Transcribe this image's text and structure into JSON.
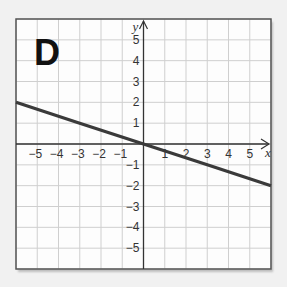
{
  "panel": {
    "label": "D"
  },
  "chart_data": {
    "type": "line",
    "title": "D",
    "xlabel": "x",
    "ylabel": "y",
    "xlim": [
      -6,
      6
    ],
    "ylim": [
      -6,
      6
    ],
    "grid": true,
    "x_ticks": [
      -5,
      -4,
      -3,
      -2,
      -1,
      1,
      2,
      3,
      4,
      5
    ],
    "y_ticks": [
      5,
      4,
      3,
      2,
      1,
      -1,
      -2,
      -3,
      -4,
      -5
    ],
    "series": [
      {
        "name": "y = -x/3",
        "x": [
          -6,
          -3,
          0,
          3,
          6
        ],
        "y": [
          2,
          1,
          0,
          -1,
          -2
        ]
      }
    ],
    "line_color": "#3a3a3a"
  }
}
